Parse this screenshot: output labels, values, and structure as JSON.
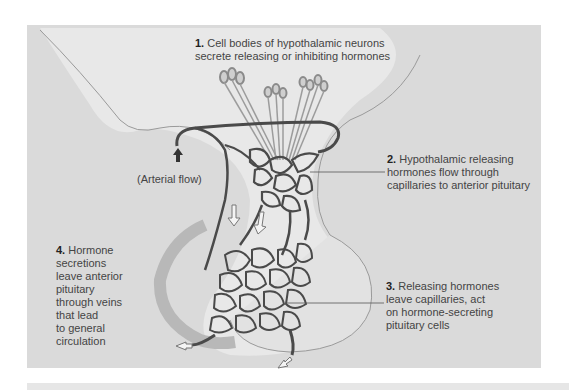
{
  "figure": {
    "colors": {
      "panel_background": "#dadada",
      "vessel": "#4a4a4a",
      "tissue_light": "#ececec",
      "text": "#444444"
    }
  },
  "labels": {
    "step1": {
      "number": "1.",
      "lines": [
        "Cell bodies of hypothalamic neurons",
        "secrete releasing or inhibiting hormones"
      ]
    },
    "step2": {
      "number": "2.",
      "lines": [
        "Hypothalamic releasing",
        "hormones flow through",
        "capillaries to anterior pituitary"
      ]
    },
    "step3": {
      "number": "3.",
      "lines": [
        "Releasing hormones",
        "leave capillaries, act",
        "on hormone-secreting",
        "pituitary cells"
      ]
    },
    "step4": {
      "number": "4.",
      "lines": [
        "Hormone",
        "secretions",
        "leave anterior",
        "pituitary",
        "through veins",
        "that lead",
        "to general",
        "circulation"
      ]
    },
    "arterial": {
      "text": "(Arterial flow)"
    }
  }
}
